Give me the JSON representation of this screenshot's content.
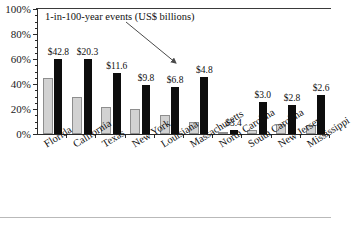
{
  "chart_data": {
    "type": "bar",
    "title": "",
    "subtitle": "",
    "annotation": "1-in-100-year events (US$ billions)",
    "xlabel": "",
    "ylabel": "",
    "ylim": [
      0,
      100
    ],
    "ytick_labels": [
      "0%",
      "20%",
      "40%",
      "60%",
      "80%",
      "100%"
    ],
    "ytick_values": [
      0,
      20,
      40,
      60,
      80,
      100
    ],
    "yminor_step": 5,
    "grid": false,
    "legend_position": "none",
    "categories": [
      "Florida",
      "California",
      "Texas",
      "New York",
      "Louisiana",
      "Massachusetts",
      "North Carolina",
      "South Carolina",
      "New Jersey",
      "Mississippi"
    ],
    "series": [
      {
        "name": "gray-series",
        "color": "#d2d2d2",
        "values": [
          45,
          30,
          22,
          20,
          15,
          10,
          1,
          3,
          8,
          7
        ]
      },
      {
        "name": "black-series",
        "color": "#0d0d0d",
        "values": [
          60,
          60,
          49,
          39,
          38,
          46,
          3,
          26,
          23,
          31
        ]
      }
    ],
    "point_labels": [
      "$42.8",
      "$20.3",
      "$11.6",
      "$9.8",
      "$6.8",
      "$4.8",
      "$3.4",
      "$3.0",
      "$2.8",
      "$2.6"
    ]
  }
}
